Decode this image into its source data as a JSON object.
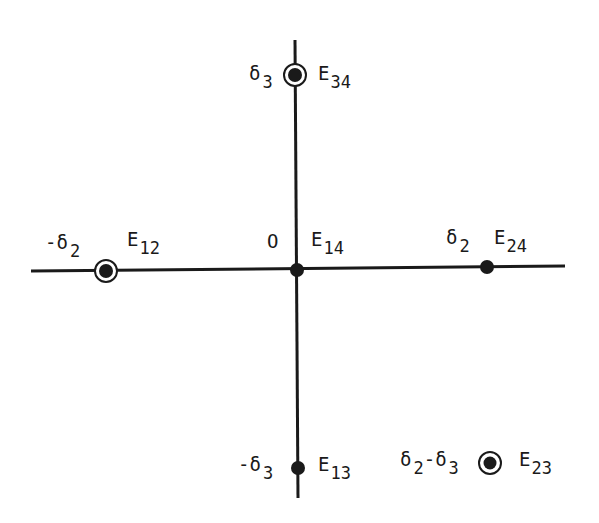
{
  "diagram": {
    "origin_label": "O",
    "axes": {
      "horizontal": {
        "x1": 31,
        "y1": 271,
        "x2": 565,
        "y2": 266
      },
      "vertical": {
        "x1": 295,
        "y1": 40,
        "x2": 298,
        "y2": 498
      }
    },
    "points": [
      {
        "id": "E34",
        "name": "E",
        "sub": "34",
        "coord_label": "δ",
        "coord_sub": "3",
        "coord_prefix": "",
        "circled": true,
        "x": 295,
        "y": 75
      },
      {
        "id": "E12",
        "name": "E",
        "sub": "12",
        "coord_label": "δ",
        "coord_sub": "2",
        "coord_prefix": "-",
        "circled": true,
        "x": 106,
        "y": 271
      },
      {
        "id": "E14",
        "name": "E",
        "sub": "14",
        "coord_label": "O",
        "coord_sub": "",
        "coord_prefix": "",
        "circled": false,
        "x": 297,
        "y": 270
      },
      {
        "id": "E24",
        "name": "E",
        "sub": "24",
        "coord_label": "δ",
        "coord_sub": "2",
        "coord_prefix": "",
        "circled": false,
        "x": 487,
        "y": 267
      },
      {
        "id": "E13",
        "name": "E",
        "sub": "13",
        "coord_label": "δ",
        "coord_sub": "3",
        "coord_prefix": "-",
        "circled": false,
        "x": 298,
        "y": 468
      },
      {
        "id": "E23",
        "name": "E",
        "sub": "23",
        "coord_label": "δ2-δ3",
        "coord_sub": "",
        "coord_prefix": "",
        "circled": true,
        "x": 490,
        "y": 463
      }
    ],
    "labels": {
      "e34": {
        "main": "E",
        "sub": "34"
      },
      "d3_top": {
        "main": "δ",
        "sub": "3"
      },
      "neg_d2": {
        "prefix": "-",
        "main": "δ",
        "sub": "2"
      },
      "e12": {
        "main": "E",
        "sub": "12"
      },
      "origin": "O",
      "e14": {
        "main": "E",
        "sub": "14"
      },
      "d2": {
        "main": "δ",
        "sub": "2"
      },
      "e24": {
        "main": "E",
        "sub": "24"
      },
      "neg_d3": {
        "prefix": "-",
        "main": "δ",
        "sub": "3"
      },
      "e13": {
        "main": "E",
        "sub": "13"
      },
      "d2_minus_d3": {
        "a": "δ",
        "a_sub": "2",
        "op": "-",
        "b": "δ",
        "b_sub": "3"
      },
      "e23": {
        "main": "E",
        "sub": "23"
      }
    },
    "colors": {
      "ink": "#1a1a1a",
      "background": "#ffffff"
    }
  }
}
